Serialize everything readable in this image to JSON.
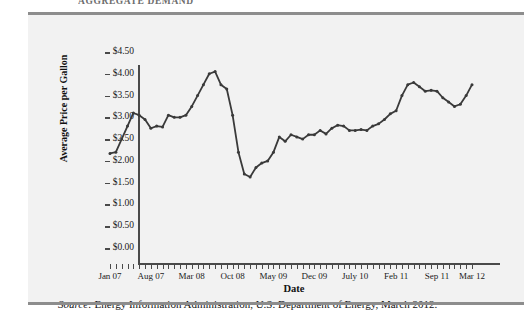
{
  "figure": {
    "top_title": "AGGREGATE DEMAND",
    "source_prefix": "Source:",
    "source_text": "Energy Information Administration, U.S. Department of Energy, March 2012.",
    "panel_bg": "#f2f2f2",
    "rule_color": "#8d8d8d",
    "line_color": "#3a3a3a"
  },
  "chart_data": {
    "type": "line",
    "title": "",
    "xlabel": "Date",
    "ylabel": "Average Price per Gallon",
    "ylim": [
      0.0,
      4.5
    ],
    "ytick_values": [
      0.0,
      0.5,
      1.0,
      1.5,
      2.0,
      2.5,
      3.0,
      3.5,
      4.0,
      4.5
    ],
    "ytick_labels": [
      "$0.00",
      "$0.50",
      "$1.00",
      "$1.50",
      "$2.00",
      "$2.50",
      "$3.00",
      "$3.50",
      "$4.00",
      "$4.50"
    ],
    "xtick_labels": [
      "Jan 07",
      "Aug 07",
      "Mar 08",
      "Oct 08",
      "May 09",
      "Dec 09",
      "July 10",
      "Feb 11",
      "Sep 11",
      "Mar 12"
    ],
    "xtick_indices": [
      0,
      7,
      14,
      21,
      28,
      35,
      42,
      49,
      56,
      62
    ],
    "grid": false,
    "legend": "none",
    "n_points": 63,
    "x": [
      "Jan 07",
      "Feb 07",
      "Mar 07",
      "Apr 07",
      "May 07",
      "Jun 07",
      "Jul 07",
      "Aug 07",
      "Sep 07",
      "Oct 07",
      "Nov 07",
      "Dec 07",
      "Jan 08",
      "Feb 08",
      "Mar 08",
      "Apr 08",
      "May 08",
      "Jun 08",
      "Jul 08",
      "Aug 08",
      "Sep 08",
      "Oct 08",
      "Nov 08",
      "Dec 08",
      "Jan 09",
      "Feb 09",
      "Mar 09",
      "Apr 09",
      "May 09",
      "Jun 09",
      "Jul 09",
      "Aug 09",
      "Sep 09",
      "Oct 09",
      "Nov 09",
      "Dec 09",
      "Jan 10",
      "Feb 10",
      "Mar 10",
      "Apr 10",
      "May 10",
      "Jun 10",
      "Jul 10",
      "Aug 10",
      "Sep 10",
      "Oct 10",
      "Nov 10",
      "Dec 10",
      "Jan 11",
      "Feb 11",
      "Mar 11",
      "Apr 11",
      "May 11",
      "Jun 11",
      "Jul 11",
      "Aug 11",
      "Sep 11",
      "Oct 11",
      "Nov 11",
      "Dec 11",
      "Jan 12",
      "Feb 12",
      "Mar 12"
    ],
    "values": [
      2.17,
      2.2,
      2.5,
      2.8,
      3.1,
      3.05,
      2.95,
      2.75,
      2.8,
      2.78,
      3.05,
      3.0,
      3.0,
      3.05,
      3.25,
      3.5,
      3.75,
      4.0,
      4.05,
      3.75,
      3.65,
      3.05,
      2.2,
      1.7,
      1.63,
      1.85,
      1.95,
      2.0,
      2.2,
      2.55,
      2.45,
      2.6,
      2.55,
      2.5,
      2.6,
      2.6,
      2.7,
      2.62,
      2.75,
      2.82,
      2.8,
      2.7,
      2.7,
      2.72,
      2.7,
      2.8,
      2.85,
      2.95,
      3.08,
      3.15,
      3.5,
      3.75,
      3.8,
      3.7,
      3.6,
      3.62,
      3.6,
      3.45,
      3.35,
      3.25,
      3.3,
      3.5,
      3.75
    ]
  }
}
